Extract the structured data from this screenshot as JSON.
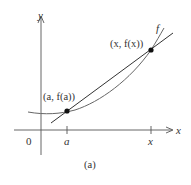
{
  "figure": {
    "caption": "(a)",
    "axes": {
      "x_label": "x",
      "y_label": "y",
      "origin_label": "0"
    },
    "ticks": {
      "a_label": "a",
      "x_label": "x"
    },
    "curve_label": "f",
    "points": {
      "left": "(a, f(a))",
      "right": "(x, f(x))"
    },
    "colors": {
      "ink": "#333333",
      "curve": "#555555",
      "background": "#ffffff"
    }
  }
}
